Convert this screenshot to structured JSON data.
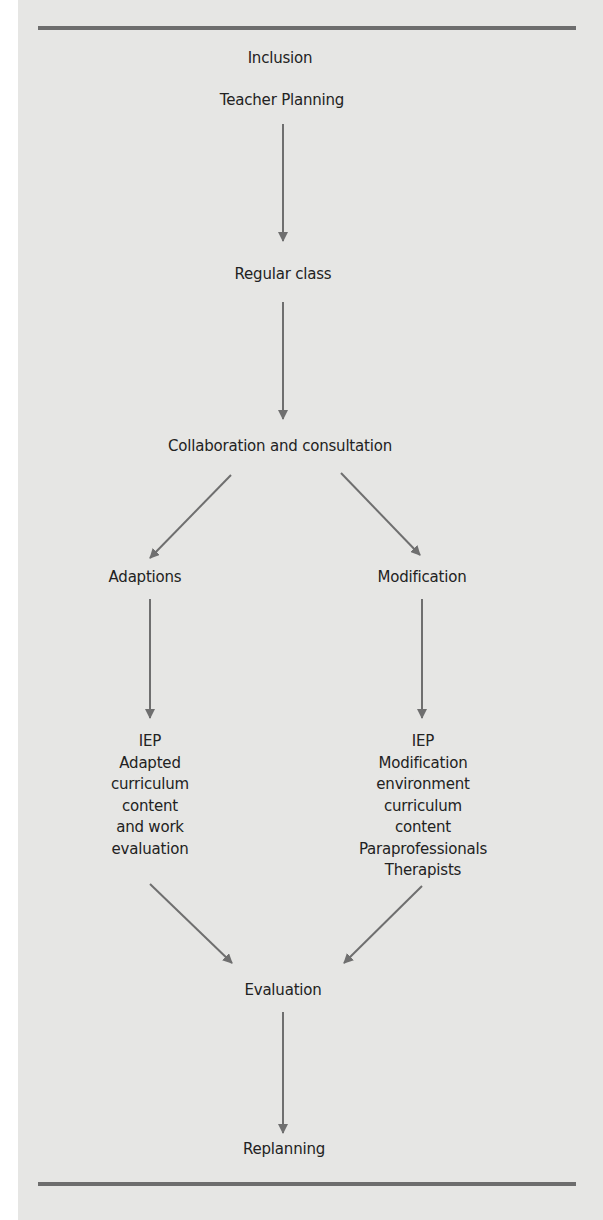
{
  "diagram": {
    "title": "Inclusion",
    "colors": {
      "background": "#e6e6e4",
      "rule": "#6d6d6d",
      "arrow": "#6f6f6f",
      "text": "#222222"
    },
    "nodes": {
      "teacher_planning": "Teacher Planning",
      "regular_class": "Regular class",
      "collaboration": "Collaboration and consultation",
      "adaptions": "Adaptions",
      "modification": "Modification",
      "adaptions_detail": [
        "IEP",
        "Adapted",
        "curriculum",
        "content",
        "and work",
        "evaluation"
      ],
      "modification_detail": [
        "IEP",
        "Modification",
        "environment",
        "curriculum",
        "content",
        "Paraprofessionals",
        "Therapists"
      ],
      "evaluation": "Evaluation",
      "replanning": "Replanning"
    },
    "edges": [
      {
        "from": "Teacher Planning",
        "to": "Regular class"
      },
      {
        "from": "Regular class",
        "to": "Collaboration and consultation"
      },
      {
        "from": "Collaboration and consultation",
        "to": "Adaptions"
      },
      {
        "from": "Collaboration and consultation",
        "to": "Modification"
      },
      {
        "from": "Adaptions",
        "to": "IEP Adapted curriculum content and work evaluation"
      },
      {
        "from": "Modification",
        "to": "IEP Modification environment curriculum content Paraprofessionals Therapists"
      },
      {
        "from": "IEP Adapted curriculum content and work evaluation",
        "to": "Evaluation"
      },
      {
        "from": "IEP Modification environment curriculum content Paraprofessionals Therapists",
        "to": "Evaluation"
      },
      {
        "from": "Evaluation",
        "to": "Replanning"
      }
    ]
  }
}
